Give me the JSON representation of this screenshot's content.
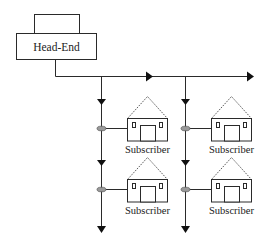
{
  "head_end": {
    "label": "Head-End"
  },
  "subscribers": [
    {
      "label": "Subscriber",
      "column": 0,
      "row": 0
    },
    {
      "label": "Subscriber",
      "column": 1,
      "row": 0
    },
    {
      "label": "Subscriber",
      "column": 0,
      "row": 1
    },
    {
      "label": "Subscriber",
      "column": 1,
      "row": 1
    }
  ],
  "colors": {
    "line": "#2a2a2a",
    "tap_fill": "#9a9a9a",
    "background": "#ffffff"
  },
  "icons": {
    "tap": "tap-oval-icon",
    "house": "house-icon",
    "arrow": "arrow-icon"
  }
}
